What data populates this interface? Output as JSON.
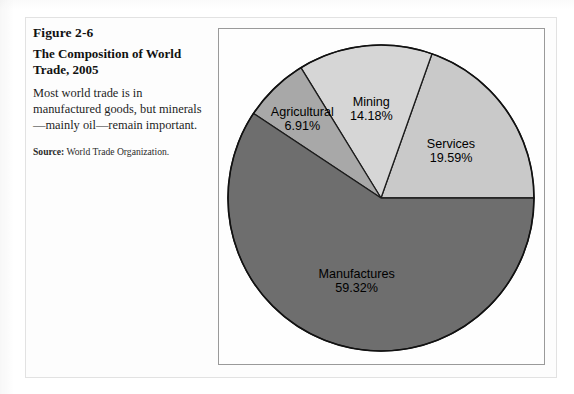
{
  "figure": {
    "number": "Figure 2-6",
    "title": "The Composition of World Trade, 2005",
    "description": "Most world trade is in manufactured goods, but minerals—mainly oil—remain important.",
    "source_label": "Source:",
    "source_text": " World Trade Organization."
  },
  "chart_data": {
    "type": "pie",
    "title": "The Composition of World Trade, 2005",
    "xlabel": "",
    "ylabel": "",
    "units": "percent",
    "legend": "none",
    "labels_on_slices": true,
    "start_angle_deg": 0,
    "direction": "counterclockwise",
    "categories": [
      "Services",
      "Mining",
      "Agricultural",
      "Manufactures"
    ],
    "values": [
      19.59,
      14.18,
      6.91,
      59.32
    ],
    "value_labels": [
      "19.59%",
      "14.18%",
      "6.91%",
      "59.32%"
    ],
    "colors": [
      "#c9c9c9",
      "#d6d6d6",
      "#a8a8a8",
      "#6e6e6e"
    ],
    "slices": [
      {
        "name": "Services",
        "value": 19.59,
        "label": "Services",
        "value_label": "19.59%",
        "color": "#c9c9c9"
      },
      {
        "name": "Mining",
        "value": 14.18,
        "label": "Mining",
        "value_label": "14.18%",
        "color": "#d6d6d6"
      },
      {
        "name": "Agricultural",
        "value": 6.91,
        "label": "Agricultural",
        "value_label": "6.91%",
        "color": "#a8a8a8"
      },
      {
        "name": "Manufactures",
        "value": 59.32,
        "label": "Manufactures",
        "value_label": "59.32%",
        "color": "#6e6e6e"
      }
    ],
    "total": 100.0
  }
}
